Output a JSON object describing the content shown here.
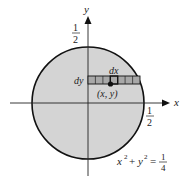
{
  "diagram": {
    "axes": {
      "x_label": "x",
      "y_label": "y"
    },
    "tick_labels": {
      "y_tick": {
        "numerator": "1",
        "denominator": "2"
      },
      "x_tick": {
        "numerator": "1",
        "denominator": "2"
      }
    },
    "strip": {
      "dx_label": "dx",
      "dy_label": "dy",
      "point_label": "(x, y)",
      "cells": 7
    },
    "equation": {
      "lhs_x": "x",
      "exp1": "2",
      "plus": " + ",
      "lhs_y": "y",
      "exp2": "2",
      "equals": " = ",
      "numerator": "1",
      "denominator": "4"
    },
    "colors": {
      "disk_fill": "#d4d4d4",
      "strip_fill": "#a8a8a8",
      "stroke": "#111111"
    }
  }
}
